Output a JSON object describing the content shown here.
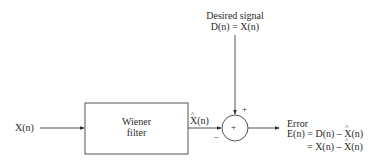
{
  "diagram": {
    "desired_signal": {
      "label": "Desired signal",
      "equation": "D(n) = X(n)"
    },
    "input": {
      "label": "X(n)"
    },
    "filter_block": {
      "line1": "Wiener",
      "line2": "filter"
    },
    "filter_output": {
      "label_prefix": "X",
      "label_suffix": "(n)"
    },
    "summer": {
      "symbol": "+",
      "plus_sign": "+",
      "minus_sign": "–"
    },
    "error": {
      "label": "Error",
      "eq1_lhs": "E(n) = D(n) – ",
      "eq1_hatvar": "X",
      "eq1_rest": "(n)",
      "eq2_lhs": "= X(n) – ",
      "eq2_hatvar": "X",
      "eq2_rest": "(n)"
    },
    "colors": {
      "line": "#2a2a2a",
      "background": "#ffffff"
    }
  }
}
